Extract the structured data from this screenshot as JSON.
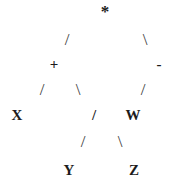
{
  "figure": {
    "kind": "expression-tree-ascii",
    "background_color": "#ffffff",
    "text_color": "#1c1c1c",
    "edge_color": "#3a3a3a",
    "width": 170,
    "height": 189
  },
  "nodes": [
    {
      "id": "root",
      "label": "*",
      "role": "operator",
      "x": 105,
      "y": 11,
      "depth": 0
    },
    {
      "id": "plus",
      "label": "+",
      "role": "operator",
      "x": 54,
      "y": 64,
      "depth": 1
    },
    {
      "id": "minus",
      "label": "-",
      "role": "operator",
      "x": 159,
      "y": 64,
      "depth": 1
    },
    {
      "id": "x",
      "label": "X",
      "role": "operand",
      "x": 17,
      "y": 115,
      "depth": 2
    },
    {
      "id": "divide",
      "label": "/",
      "role": "operator",
      "x": 94,
      "y": 115,
      "depth": 2
    },
    {
      "id": "w",
      "label": "W",
      "role": "operand",
      "x": 133,
      "y": 115,
      "depth": 2
    },
    {
      "id": "y",
      "label": "Y",
      "role": "operand",
      "x": 69,
      "y": 170,
      "depth": 3
    },
    {
      "id": "z",
      "label": "Z",
      "role": "operand",
      "x": 134,
      "y": 170,
      "depth": 3
    }
  ],
  "edges": [
    {
      "id": "root-plus",
      "glyph": "/",
      "from": "root",
      "to": "plus",
      "x": 67,
      "y": 39
    },
    {
      "id": "root-minus",
      "glyph": "\\",
      "from": "root",
      "to": "minus",
      "x": 145,
      "y": 39
    },
    {
      "id": "plus-x",
      "glyph": "/",
      "from": "plus",
      "to": "x",
      "x": 42,
      "y": 89
    },
    {
      "id": "plus-divide",
      "glyph": "\\",
      "from": "plus",
      "to": "divide",
      "x": 78,
      "y": 89
    },
    {
      "id": "minus-w",
      "glyph": "/",
      "from": "minus",
      "to": "w",
      "x": 143,
      "y": 89
    },
    {
      "id": "divide-y",
      "glyph": "/",
      "from": "divide",
      "to": "y",
      "x": 83,
      "y": 141
    },
    {
      "id": "divide-z",
      "glyph": "\\",
      "from": "divide",
      "to": "z",
      "x": 120,
      "y": 141
    }
  ]
}
